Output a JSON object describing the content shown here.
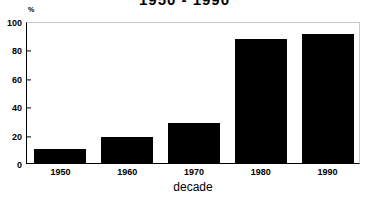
{
  "chart_data": {
    "type": "bar",
    "title": "1950 - 1990",
    "title_note": "cropped at top edge of screenshot",
    "categories": [
      "1950",
      "1960",
      "1970",
      "1980",
      "1990"
    ],
    "values": [
      10,
      18,
      28,
      87,
      91
    ],
    "xlabel": "decade",
    "ylabel": "",
    "yunit": "%",
    "ylim": [
      0,
      100
    ],
    "yticks": [
      0,
      20,
      40,
      60,
      80,
      100
    ],
    "ytick_labels": [
      "0",
      "20",
      "40",
      "60",
      "80",
      "100"
    ],
    "grid": false,
    "legend": null,
    "bar_color": "#000000",
    "background_color": "#ffffff",
    "axis_color": "#000000"
  }
}
